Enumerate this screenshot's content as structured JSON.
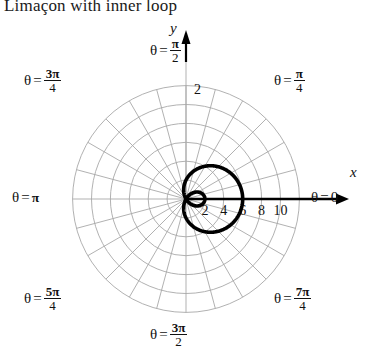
{
  "title": "Limaçon with inner loop",
  "axes": {
    "x_name": "x",
    "y_name": "y",
    "x_ticks": [
      "2",
      "4",
      "6",
      "8",
      "10"
    ],
    "x_tick_values": [
      2,
      4,
      6,
      8,
      10
    ],
    "y_tick": "2"
  },
  "theta_labels": [
    {
      "name": "theta-0",
      "prefix": "θ =",
      "value": "0",
      "kind": "plain",
      "num": "",
      "den": "",
      "deg": 0
    },
    {
      "name": "theta-pi-4",
      "prefix": "θ =",
      "value": "π/4",
      "kind": "fraction",
      "num": "π",
      "den": "4",
      "deg": 45
    },
    {
      "name": "theta-pi-2",
      "prefix": "θ =",
      "value": "π/2",
      "kind": "fraction",
      "num": "π",
      "den": "2",
      "deg": 90
    },
    {
      "name": "theta-3pi-4",
      "prefix": "θ =",
      "value": "3π/4",
      "kind": "fraction",
      "num": "3π",
      "den": "4",
      "deg": 135
    },
    {
      "name": "theta-pi",
      "prefix": "θ =",
      "value": "π",
      "kind": "plain",
      "num": "",
      "den": "",
      "deg": 180
    },
    {
      "name": "theta-5pi-4",
      "prefix": "θ =",
      "value": "5π/4",
      "kind": "fraction",
      "num": "5π",
      "den": "4",
      "deg": 225
    },
    {
      "name": "theta-3pi-2",
      "prefix": "θ =",
      "value": "3π/2",
      "kind": "fraction",
      "num": "3π",
      "den": "2",
      "deg": 270
    },
    {
      "name": "theta-7pi-4",
      "prefix": "θ =",
      "value": "7π/4",
      "kind": "fraction",
      "num": "7π",
      "den": "4",
      "deg": 315
    }
  ],
  "chart_data": {
    "type": "line",
    "coordinate_system": "polar",
    "title": "Limaçon with inner loop",
    "equation": "r = 2 + 4 cos θ",
    "curve_params": {
      "a": 2,
      "b": 4,
      "form": "a + b cos(theta)"
    },
    "r_max_outer": 6,
    "r_inner_loop": 2,
    "theta_range_deg": [
      0,
      360
    ],
    "grid": {
      "on": true,
      "circles_r": [
        2,
        4,
        6,
        8,
        10,
        12
      ],
      "spokes_count": 24,
      "spoke_step_deg": 15,
      "color": "#a8a8a8"
    },
    "axis_color": "#000000",
    "curve_color": "#000000",
    "curve_width_px": 3.6,
    "xlabel": "x",
    "ylabel": "y",
    "xlim": [
      -12,
      12
    ],
    "ylim": [
      -12,
      12
    ]
  },
  "colors": {
    "background": "#ffffff",
    "grid": "#a8a8a8",
    "curve": "#000000",
    "text": "#111111"
  }
}
